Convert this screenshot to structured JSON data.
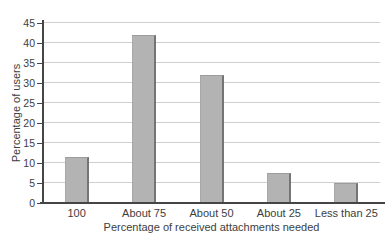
{
  "chart_data": {
    "type": "bar",
    "categories": [
      "100",
      "About 75",
      "About 50",
      "About 25",
      "Less than 25"
    ],
    "values": [
      11.5,
      42,
      32,
      7.5,
      5
    ],
    "title": "",
    "xlabel": "Percentage of received attachments needed",
    "ylabel": "Percentage of users",
    "ylim": [
      0,
      45
    ],
    "ytick_step": 5,
    "grid": true,
    "legend": "none",
    "colors": {
      "bar_fill": "#b3b3b3",
      "bar_edge_right": "#757575",
      "bar_edge_top": "#9c9c9c",
      "bar_edge_left": "#a8a8a8",
      "gridline": "#cfcfcf",
      "axis": "#454545",
      "text": "#3d3d3d",
      "background": "#ffffff"
    }
  }
}
